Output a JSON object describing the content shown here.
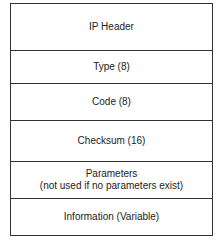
{
  "diagram": {
    "fields": [
      {
        "label": "IP Header"
      },
      {
        "label": "Type (8)"
      },
      {
        "label": "Code (8)"
      },
      {
        "label": "Checksum (16)"
      },
      {
        "label": "Parameters",
        "sublabel": "(not used if no parameters exist)"
      },
      {
        "label": "Information (Variable)"
      }
    ]
  }
}
